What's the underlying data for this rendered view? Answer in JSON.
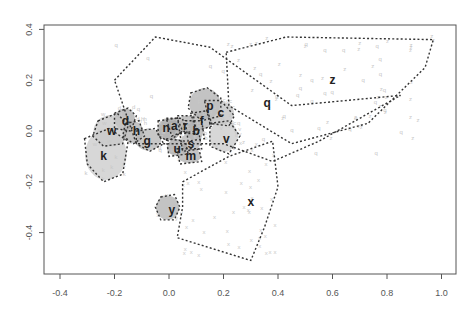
{
  "chart_data": {
    "type": "scatter",
    "title": "",
    "xlabel": "",
    "ylabel": "",
    "xlim": [
      -0.45,
      1.01
    ],
    "ylim": [
      -0.56,
      0.42
    ],
    "grid": false,
    "legend": null,
    "x_ticks": [
      -0.4,
      -0.2,
      0.0,
      0.2,
      0.4,
      0.6,
      0.8,
      1.0
    ],
    "x_tick_labels": [
      "-0.4",
      "-0.2",
      "0.0",
      "0.2",
      "0.4",
      "0.6",
      "0.8",
      "1.0"
    ],
    "y_ticks": [
      -0.4,
      -0.2,
      0.0,
      0.2,
      0.4
    ],
    "y_tick_labels": [
      "-0.4",
      "-0.2",
      "0.0",
      "0.2",
      "0.4"
    ],
    "clusters": [
      {
        "label": "q",
        "x": 0.36,
        "y": 0.11,
        "hull": [
          [
            -0.2,
            0.2
          ],
          [
            -0.05,
            0.37
          ],
          [
            0.15,
            0.33
          ],
          [
            0.45,
            0.1
          ],
          [
            0.85,
            0.14
          ],
          [
            0.55,
            -0.04
          ],
          [
            0.38,
            -0.12
          ],
          [
            0.2,
            -0.05
          ],
          [
            -0.12,
            -0.05
          ]
        ],
        "shade": 0
      },
      {
        "label": "z",
        "x": 0.6,
        "y": 0.2,
        "hull": [
          [
            0.21,
            0.31
          ],
          [
            0.43,
            0.37
          ],
          [
            0.97,
            0.36
          ],
          [
            0.94,
            0.25
          ],
          [
            0.73,
            0.03
          ],
          [
            0.45,
            -0.05
          ],
          [
            0.22,
            0.1
          ]
        ],
        "shade": 0
      },
      {
        "label": "p",
        "x": 0.15,
        "y": 0.1,
        "hull": [
          [
            0.08,
            0.15
          ],
          [
            0.14,
            0.17
          ],
          [
            0.19,
            0.13
          ],
          [
            0.19,
            0.06
          ],
          [
            0.12,
            0.04
          ],
          [
            0.07,
            0.09
          ]
        ],
        "shade": 0.55
      },
      {
        "label": "c",
        "x": 0.19,
        "y": 0.07,
        "hull": [
          [
            0.13,
            0.12
          ],
          [
            0.19,
            0.12
          ],
          [
            0.24,
            0.06
          ],
          [
            0.22,
            0.02
          ],
          [
            0.15,
            0.03
          ]
        ],
        "shade": 0.4
      },
      {
        "label": "d",
        "x": -0.16,
        "y": 0.04,
        "hull": [
          [
            -0.2,
            0.07
          ],
          [
            -0.15,
            0.09
          ],
          [
            -0.12,
            0.06
          ],
          [
            -0.14,
            0.0
          ],
          [
            -0.2,
            0.01
          ]
        ],
        "shade": 0.6
      },
      {
        "label": "w",
        "x": -0.21,
        "y": 0.0,
        "hull": [
          [
            -0.26,
            0.04
          ],
          [
            -0.19,
            0.07
          ],
          [
            -0.15,
            0.02
          ],
          [
            -0.17,
            -0.05
          ],
          [
            -0.24,
            -0.06
          ],
          [
            -0.28,
            -0.02
          ]
        ],
        "shade": 0.35
      },
      {
        "label": "h",
        "x": -0.12,
        "y": 0.0,
        "hull": [
          [
            -0.16,
            0.03
          ],
          [
            -0.11,
            0.04
          ],
          [
            -0.09,
            -0.02
          ],
          [
            -0.13,
            -0.05
          ],
          [
            -0.17,
            -0.02
          ]
        ],
        "shade": 0.55
      },
      {
        "label": "g",
        "x": -0.08,
        "y": -0.04,
        "hull": [
          [
            -0.12,
            0.0
          ],
          [
            -0.05,
            0.01
          ],
          [
            -0.02,
            -0.05
          ],
          [
            -0.07,
            -0.08
          ],
          [
            -0.12,
            -0.05
          ]
        ],
        "shade": 0.5
      },
      {
        "label": "k",
        "x": -0.24,
        "y": -0.1,
        "hull": [
          [
            -0.31,
            -0.03
          ],
          [
            -0.22,
            0.01
          ],
          [
            -0.15,
            -0.04
          ],
          [
            -0.17,
            -0.17
          ],
          [
            -0.24,
            -0.2
          ],
          [
            -0.3,
            -0.13
          ]
        ],
        "shade": 0.3
      },
      {
        "label": "v",
        "x": 0.21,
        "y": -0.03,
        "hull": [
          [
            0.15,
            0.03
          ],
          [
            0.22,
            0.04
          ],
          [
            0.26,
            -0.02
          ],
          [
            0.22,
            -0.09
          ],
          [
            0.15,
            -0.06
          ]
        ],
        "shade": 0.3
      },
      {
        "label": "x",
        "x": 0.3,
        "y": -0.28,
        "hull": [
          [
            0.05,
            -0.2
          ],
          [
            0.22,
            -0.1
          ],
          [
            0.38,
            -0.04
          ],
          [
            0.4,
            -0.22
          ],
          [
            0.35,
            -0.38
          ],
          [
            0.3,
            -0.51
          ],
          [
            0.03,
            -0.42
          ],
          [
            0.05,
            -0.3
          ]
        ],
        "shade": 0
      },
      {
        "label": "y",
        "x": 0.01,
        "y": -0.31,
        "hull": [
          [
            -0.03,
            -0.26
          ],
          [
            0.02,
            -0.25
          ],
          [
            0.04,
            -0.3
          ],
          [
            0.02,
            -0.35
          ],
          [
            -0.03,
            -0.35
          ],
          [
            -0.05,
            -0.3
          ]
        ],
        "shade": 0.55
      },
      {
        "label": "n",
        "x": -0.01,
        "y": 0.01,
        "hull": [
          [
            -0.04,
            0.04
          ],
          [
            0.03,
            0.05
          ],
          [
            0.05,
            0.0
          ],
          [
            0.0,
            -0.04
          ],
          [
            -0.04,
            -0.02
          ]
        ],
        "shade": 0.7
      },
      {
        "label": "a",
        "x": 0.02,
        "y": 0.02,
        "hull": [
          [
            -0.01,
            0.05
          ],
          [
            0.05,
            0.05
          ],
          [
            0.06,
            0.0
          ],
          [
            0.01,
            -0.02
          ]
        ],
        "shade": 0.6
      },
      {
        "label": "r",
        "x": 0.06,
        "y": 0.02,
        "hull": [
          [
            0.03,
            0.06
          ],
          [
            0.09,
            0.06
          ],
          [
            0.1,
            0.0
          ],
          [
            0.04,
            -0.01
          ]
        ],
        "shade": 0.55
      },
      {
        "label": "f",
        "x": 0.12,
        "y": 0.04,
        "hull": [
          [
            0.08,
            0.07
          ],
          [
            0.14,
            0.08
          ],
          [
            0.16,
            0.02
          ],
          [
            0.1,
            0.0
          ]
        ],
        "shade": 0.5
      },
      {
        "label": "b",
        "x": 0.1,
        "y": 0.0,
        "hull": [
          [
            0.06,
            0.04
          ],
          [
            0.12,
            0.04
          ],
          [
            0.13,
            -0.03
          ],
          [
            0.07,
            -0.04
          ]
        ],
        "shade": 0.55
      },
      {
        "label": "s",
        "x": 0.08,
        "y": -0.05,
        "hull": [
          [
            0.04,
            -0.01
          ],
          [
            0.11,
            -0.01
          ],
          [
            0.12,
            -0.07
          ],
          [
            0.05,
            -0.08
          ]
        ],
        "shade": 0.5
      },
      {
        "label": "u",
        "x": 0.03,
        "y": -0.07,
        "hull": [
          [
            -0.01,
            -0.03
          ],
          [
            0.06,
            -0.04
          ],
          [
            0.07,
            -0.09
          ],
          [
            0.0,
            -0.1
          ]
        ],
        "shade": 0.65
      },
      {
        "label": "m",
        "x": 0.08,
        "y": -0.1,
        "hull": [
          [
            0.03,
            -0.07
          ],
          [
            0.11,
            -0.07
          ],
          [
            0.12,
            -0.12
          ],
          [
            0.04,
            -0.13
          ]
        ],
        "shade": 0.55
      }
    ]
  }
}
